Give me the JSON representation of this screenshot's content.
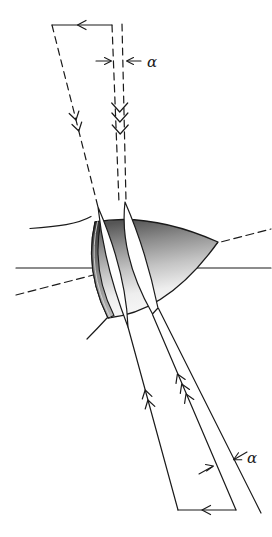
{
  "figure": {
    "labels": {
      "alpha_upper": "α",
      "alpha_lower": "α"
    },
    "colors": {
      "stroke": "#1a1a1a",
      "background": "#ffffff",
      "body_dark": "#565656",
      "body_upper_mid": "#8c8c8c",
      "body_mid": "#c4c4c4",
      "body_light": "#eeeeee",
      "body_lightest": "#fafafa",
      "base_dark": "#2e2e2e",
      "base_mid": "#8a8a8a",
      "base_light": "#b8b8b8",
      "slice_fill": "#ffffff"
    }
  }
}
